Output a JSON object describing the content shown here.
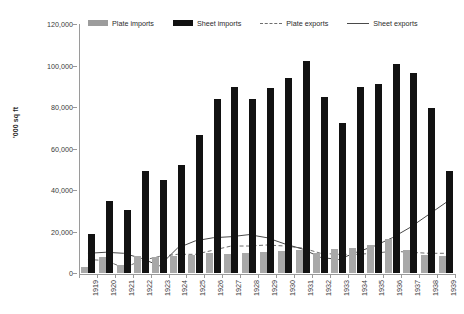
{
  "chart_data": {
    "type": "bar",
    "title": "",
    "subtitle": "",
    "xlabel": "",
    "ylabel": "'000 sq ft",
    "ylim": [
      0,
      120000
    ],
    "ytick_values": [
      0,
      20000,
      40000,
      60000,
      80000,
      100000,
      120000
    ],
    "ytick_labels": [
      "0",
      "20,000",
      "40,000",
      "60,000",
      "80,000",
      "100,000",
      "120,000"
    ],
    "grid": false,
    "legend_position": "top",
    "categories": [
      "1919",
      "1920",
      "1921",
      "1922",
      "1923",
      "1924",
      "1925",
      "1926",
      "1927",
      "1928",
      "1929",
      "1930",
      "1931",
      "1932",
      "1933",
      "1934",
      "1935",
      "1936",
      "1937",
      "1938",
      "1939"
    ],
    "series": [
      {
        "name": "Plate imports",
        "kind": "bar",
        "color": "#a8a8a8",
        "values": [
          3000,
          7500,
          4000,
          8000,
          7500,
          8000,
          8500,
          9500,
          9000,
          9500,
          10000,
          10500,
          11000,
          9500,
          11500,
          12000,
          13500,
          16500,
          11000,
          8500,
          8000
        ]
      },
      {
        "name": "Sheet imports",
        "kind": "bar",
        "color": "#121212",
        "values": [
          19000,
          34500,
          30500,
          49000,
          45000,
          52000,
          66500,
          84000,
          89500,
          84000,
          89000,
          94000,
          102000,
          85000,
          72500,
          89500,
          91000,
          100500,
          96500,
          79500,
          49000
        ]
      },
      {
        "name": "Plate exports",
        "kind": "line",
        "style": "dashed",
        "color": "#6e6e6e",
        "values": [
          6500,
          6000,
          2500,
          6000,
          8000,
          9000,
          9000,
          11000,
          13000,
          13000,
          13500,
          13000,
          12000,
          9500,
          9000,
          9000,
          9500,
          10500,
          10000,
          9500,
          9500
        ]
      },
      {
        "name": "Sheet exports",
        "kind": "line",
        "style": "solid",
        "color": "#4a4a4a",
        "values": [
          9500,
          10000,
          9500,
          7000,
          3500,
          12000,
          15500,
          17000,
          17500,
          18500,
          17000,
          14000,
          11500,
          7500,
          6500,
          10000,
          13000,
          17000,
          22000,
          28000,
          34000
        ]
      }
    ]
  },
  "legend": {
    "items": [
      {
        "label": "Plate imports",
        "swatch": "gray-bar-swatch"
      },
      {
        "label": "Sheet imports",
        "swatch": "black-bar-swatch"
      },
      {
        "label": "Plate exports",
        "swatch": "dashed-line-swatch"
      },
      {
        "label": "Sheet exports",
        "swatch": "solid-line-swatch"
      }
    ]
  }
}
